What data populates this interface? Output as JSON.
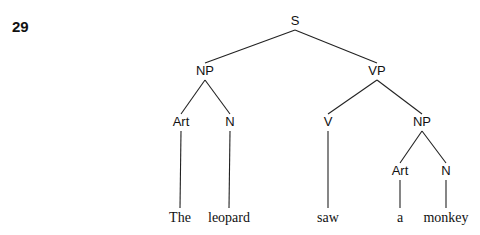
{
  "figure_number": "29",
  "tree": {
    "nodes": [
      {
        "id": "S",
        "label": "S",
        "kind": "phrase"
      },
      {
        "id": "NP1",
        "label": "NP",
        "kind": "phrase",
        "parent": "S"
      },
      {
        "id": "VP",
        "label": "VP",
        "kind": "phrase",
        "parent": "S"
      },
      {
        "id": "Art1",
        "label": "Art",
        "kind": "category",
        "parent": "NP1"
      },
      {
        "id": "N1",
        "label": "N",
        "kind": "category",
        "parent": "NP1"
      },
      {
        "id": "V",
        "label": "V",
        "kind": "category",
        "parent": "VP"
      },
      {
        "id": "NP2",
        "label": "NP",
        "kind": "phrase",
        "parent": "VP"
      },
      {
        "id": "Art2",
        "label": "Art",
        "kind": "category",
        "parent": "NP2"
      },
      {
        "id": "N2",
        "label": "N",
        "kind": "category",
        "parent": "NP2"
      },
      {
        "id": "w1",
        "label": "The",
        "kind": "word",
        "parent": "Art1"
      },
      {
        "id": "w2",
        "label": "leopard",
        "kind": "word",
        "parent": "N1"
      },
      {
        "id": "w3",
        "label": "saw",
        "kind": "word",
        "parent": "V"
      },
      {
        "id": "w4",
        "label": "a",
        "kind": "word",
        "parent": "Art2"
      },
      {
        "id": "w5",
        "label": "monkey",
        "kind": "word",
        "parent": "N2"
      }
    ]
  }
}
